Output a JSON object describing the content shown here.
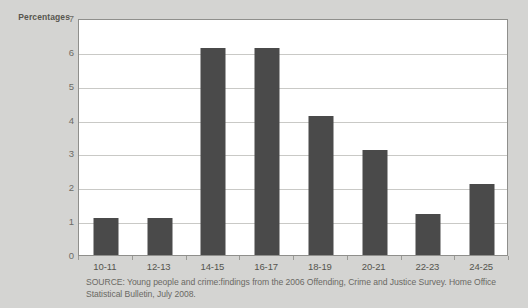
{
  "chart_data": {
    "type": "bar",
    "title": "",
    "ylabel": "Percentages",
    "xlabel": "",
    "categories": [
      "10-11",
      "12-13",
      "14-15",
      "16-17",
      "18-19",
      "20-21",
      "22-23",
      "24-25"
    ],
    "values": [
      1.1,
      1.1,
      6.1,
      6.1,
      4.1,
      3.1,
      1.2,
      2.1
    ],
    "ylim": [
      0,
      7
    ],
    "ytick_labels": [
      "0",
      "1",
      "2",
      "3",
      "4",
      "5",
      "6",
      "7"
    ],
    "ytick_values": [
      0,
      1,
      2,
      3,
      4,
      5,
      6,
      7
    ],
    "grid": true,
    "legend": null,
    "series": [
      {
        "name": "Percentages",
        "values": [
          1.1,
          1.1,
          6.1,
          6.1,
          4.1,
          3.1,
          1.2,
          2.1
        ]
      }
    ],
    "bar_color": "#4a4a4a",
    "plot_background": "#ffffff",
    "figure_background": "#d4d4d2"
  },
  "source": {
    "line1": "SOURCE: Young people and crime:findings from the 2006 Offending, Crime and Justice Survey. Home Office",
    "line2": "Statistical Bulletin, July 2008."
  }
}
